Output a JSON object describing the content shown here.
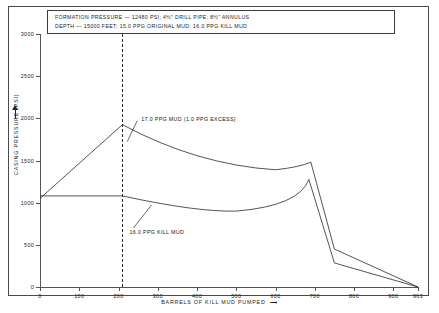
{
  "note": {
    "line1": "FORMATION PRESSURE — 12480 PSI; 4½\" DRILL PIPE; 8½\" ANNULUS",
    "line2": "DEPTH — 15000 FEET; 15.0 PPG ORIGINAL MUD; 16.0 PPG KILL MUD"
  },
  "chart_data": {
    "type": "line",
    "title": "",
    "xlabel": "BARRELS OF KILL MUD PUMPED",
    "ylabel": "CASING PRESSURE (PSI)",
    "xlim": [
      0,
      963
    ],
    "ylim": [
      0,
      3000
    ],
    "grid": false,
    "legend": "inline-annotations",
    "x_ticks": [
      0,
      100,
      200,
      300,
      400,
      500,
      600,
      700,
      800,
      900,
      963
    ],
    "x_tick_labels": [
      "0",
      "100",
      "200",
      "300",
      "400",
      "500",
      "600",
      "700",
      "800",
      "900",
      "963"
    ],
    "y_ticks": [
      0,
      500,
      1000,
      1500,
      2000,
      2500,
      3000
    ],
    "y_tick_labels": [
      "0",
      "500",
      "1000",
      "1500",
      "2000",
      "2500",
      "3000"
    ],
    "annotations": [
      {
        "name": "drill-pipe-displacement-marker",
        "type": "vline",
        "x": 210,
        "label": ""
      }
    ],
    "series": [
      {
        "name": "17.0 PPG MUD (1.0 PPG EXCESS)",
        "label": "17.0 PPG MUD (1.0 PPG EXCESS)",
        "label_x": 258,
        "label_y": 1985,
        "points": [
          [
            0,
            1050
          ],
          [
            210,
            1925
          ],
          [
            300,
            1700
          ],
          [
            400,
            1545
          ],
          [
            500,
            1440
          ],
          [
            600,
            1390
          ],
          [
            660,
            1420
          ],
          [
            690,
            1480
          ],
          [
            750,
            450
          ],
          [
            963,
            0
          ]
        ]
      },
      {
        "name": "16.0 PPG KILL MUD",
        "label": "16.0 PPG KILL MUD",
        "label_x": 228,
        "label_y": 640,
        "points": [
          [
            0,
            1080
          ],
          [
            210,
            1080
          ],
          [
            300,
            1010
          ],
          [
            400,
            935
          ],
          [
            500,
            900
          ],
          [
            600,
            945
          ],
          [
            660,
            1080
          ],
          [
            685,
            1275
          ],
          [
            750,
            285
          ],
          [
            963,
            0
          ]
        ]
      }
    ]
  }
}
